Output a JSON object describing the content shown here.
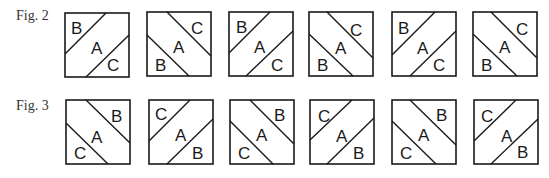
{
  "figures": [
    {
      "label": "Fig. 2",
      "tiles": [
        {
          "diagonal": "ascending",
          "corner_a": "B",
          "center": "A",
          "corner_b": "C"
        },
        {
          "diagonal": "descending",
          "corner_a": "C",
          "center": "A",
          "corner_b": "B"
        },
        {
          "diagonal": "ascending",
          "corner_a": "B",
          "center": "A",
          "corner_b": "C"
        },
        {
          "diagonal": "descending",
          "corner_a": "C",
          "center": "A",
          "corner_b": "B"
        },
        {
          "diagonal": "ascending",
          "corner_a": "B",
          "center": "A",
          "corner_b": "C"
        },
        {
          "diagonal": "descending",
          "corner_a": "C",
          "center": "A",
          "corner_b": "B"
        }
      ]
    },
    {
      "label": "Fig. 3",
      "tiles": [
        {
          "diagonal": "descending",
          "corner_a": "B",
          "center": "A",
          "corner_b": "C"
        },
        {
          "diagonal": "ascending",
          "corner_a": "C",
          "center": "A",
          "corner_b": "B"
        },
        {
          "diagonal": "descending",
          "corner_a": "B",
          "center": "A",
          "corner_b": "C"
        },
        {
          "diagonal": "ascending",
          "corner_a": "C",
          "center": "A",
          "corner_b": "B"
        },
        {
          "diagonal": "descending",
          "corner_a": "B",
          "center": "A",
          "corner_b": "C"
        },
        {
          "diagonal": "ascending",
          "corner_a": "C",
          "center": "A",
          "corner_b": "B"
        }
      ]
    }
  ],
  "stroke_color": "#1a1a1a"
}
